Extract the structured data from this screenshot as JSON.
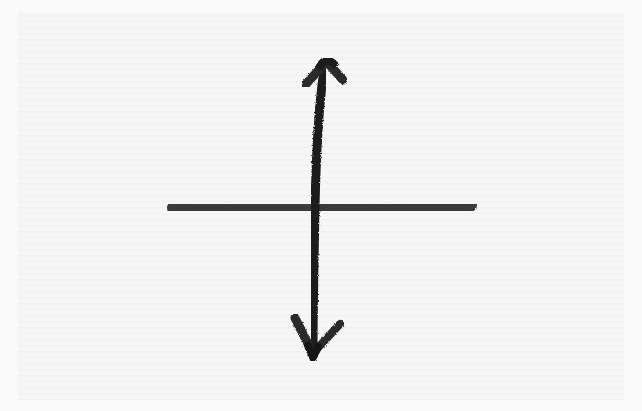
{
  "figure": {
    "description": "Hand-drawn charcoal sketch of a cross: a horizontal line intersected by a vertical double-headed arrow",
    "background_color": "#f6f6f6",
    "stroke_color": "#1e1e1e",
    "elements": {
      "horizontal_line": {
        "x1": 173,
        "y1": 207,
        "x2": 472,
        "y2": 206
      },
      "vertical_arrow": {
        "top": [
          325,
          62
        ],
        "intersection": [
          314,
          207
        ],
        "bottom": [
          313,
          355
        ]
      },
      "top_arrowhead": {
        "tip": [
          327,
          58
        ],
        "left": [
          302,
          88
        ],
        "right": [
          346,
          82
        ]
      },
      "bottom_arrowhead": {
        "tip": [
          313,
          358
        ],
        "left": [
          293,
          315
        ],
        "right": [
          342,
          322
        ]
      }
    }
  }
}
